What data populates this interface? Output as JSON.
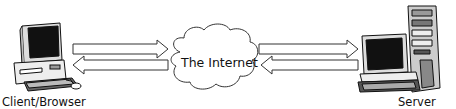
{
  "diagram": {
    "nodes": [
      {
        "id": "client",
        "label": "Client/Browser",
        "icon": "desktop-computer-icon"
      },
      {
        "id": "internet",
        "label": "The Internet",
        "icon": "cloud-icon"
      },
      {
        "id": "server",
        "label": "Server",
        "icon": "server-tower-icon"
      }
    ],
    "edges": [
      {
        "from": "client",
        "to": "internet",
        "direction": "right"
      },
      {
        "from": "internet",
        "to": "client",
        "direction": "left"
      },
      {
        "from": "internet",
        "to": "server",
        "direction": "right"
      },
      {
        "from": "server",
        "to": "internet",
        "direction": "left"
      }
    ]
  }
}
